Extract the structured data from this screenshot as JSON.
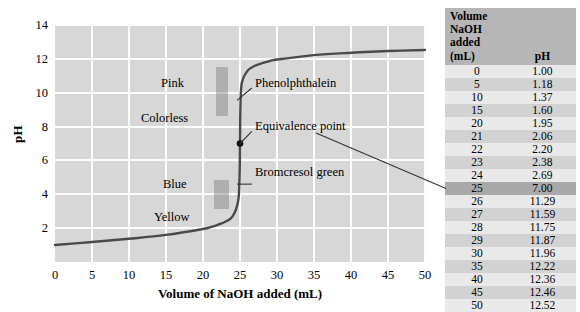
{
  "chart_data": {
    "type": "line",
    "title": "",
    "xlabel": "Volume of NaOH added (mL)",
    "ylabel": "pH",
    "xlim": [
      0,
      50
    ],
    "ylim": [
      0,
      14
    ],
    "xticks": [
      0,
      5,
      10,
      15,
      20,
      25,
      30,
      35,
      40,
      45,
      50
    ],
    "yticks": [
      2,
      4,
      6,
      8,
      10,
      12,
      14
    ],
    "grid": true,
    "legend": "none",
    "x": [
      0,
      5,
      10,
      15,
      20,
      21,
      22,
      23,
      24,
      25,
      26,
      27,
      28,
      29,
      30,
      35,
      40,
      45,
      50
    ],
    "y": [
      1.0,
      1.18,
      1.37,
      1.6,
      1.95,
      2.06,
      2.2,
      2.38,
      2.69,
      7.0,
      11.29,
      11.59,
      11.75,
      11.87,
      11.96,
      12.22,
      12.36,
      12.46,
      12.52
    ],
    "series": [
      {
        "name": "Titration curve",
        "values": [
          1.0,
          1.18,
          1.37,
          1.6,
          1.95,
          2.06,
          2.2,
          2.38,
          2.69,
          7.0,
          11.29,
          11.59,
          11.75,
          11.87,
          11.96,
          12.22,
          12.36,
          12.46,
          12.52
        ]
      }
    ],
    "annotations": [
      {
        "label": "Pink",
        "x": 14.5,
        "y": 10.3
      },
      {
        "label": "Colorless",
        "x": 11.5,
        "y": 8.2
      },
      {
        "label": "Blue",
        "x": 14.6,
        "y": 4.9
      },
      {
        "label": "Yellow",
        "x": 13.5,
        "y": 3.0
      },
      {
        "label": "Phenolphthalein",
        "x": 27.0,
        "y": 10.3
      },
      {
        "label": "Equivalence point",
        "x": 27.0,
        "y": 7.7
      },
      {
        "label": "Bromcresol green",
        "x": 27.0,
        "y": 5.0
      }
    ],
    "equivalence_point": {
      "x": 25,
      "y": 7.0
    },
    "indicator_bands": [
      {
        "name": "Phenolphthalein",
        "ph_low": 8.3,
        "ph_high": 10.6
      },
      {
        "name": "Bromcresol green",
        "ph_low": 3.8,
        "ph_high": 5.4
      }
    ]
  },
  "axes": {
    "y_title": "pH",
    "x_title": "Volume of NaOH added (mL)",
    "y_ticks": [
      "14",
      "12",
      "10",
      "8",
      "6",
      "4",
      "2"
    ],
    "x_ticks": [
      "0",
      "5",
      "10",
      "15",
      "20",
      "25",
      "30",
      "35",
      "40",
      "45",
      "50"
    ]
  },
  "annotations": {
    "pink": "Pink",
    "colorless": "Colorless",
    "blue": "Blue",
    "yellow": "Yellow",
    "phenolphthalein": "Phenolphthalein",
    "equivalence_point": "Equivalence point",
    "bromcresol_green": "Bromcresol green"
  },
  "table": {
    "headers": {
      "volume": "Volume NaOH added (mL)",
      "volume_line1": "Volume NaOH",
      "volume_line2": "added (mL)",
      "ph": "pH"
    },
    "rows": [
      {
        "volume": "0",
        "ph": "1.00",
        "highlight": false
      },
      {
        "volume": "5",
        "ph": "1.18",
        "highlight": false
      },
      {
        "volume": "10",
        "ph": "1.37",
        "highlight": false
      },
      {
        "volume": "15",
        "ph": "1.60",
        "highlight": false
      },
      {
        "volume": "20",
        "ph": "1.95",
        "highlight": false
      },
      {
        "volume": "21",
        "ph": "2.06",
        "highlight": false
      },
      {
        "volume": "22",
        "ph": "2.20",
        "highlight": false
      },
      {
        "volume": "23",
        "ph": "2.38",
        "highlight": false
      },
      {
        "volume": "24",
        "ph": "2.69",
        "highlight": false
      },
      {
        "volume": "25",
        "ph": "7.00",
        "highlight": true
      },
      {
        "volume": "26",
        "ph": "11.29",
        "highlight": false
      },
      {
        "volume": "27",
        "ph": "11.59",
        "highlight": false
      },
      {
        "volume": "28",
        "ph": "11.75",
        "highlight": false
      },
      {
        "volume": "29",
        "ph": "11.87",
        "highlight": false
      },
      {
        "volume": "30",
        "ph": "11.96",
        "highlight": false
      },
      {
        "volume": "35",
        "ph": "12.22",
        "highlight": false
      },
      {
        "volume": "40",
        "ph": "12.36",
        "highlight": false
      },
      {
        "volume": "45",
        "ph": "12.46",
        "highlight": false
      },
      {
        "volume": "50",
        "ph": "12.52",
        "highlight": false
      }
    ]
  },
  "colors": {
    "plot_background": "#d7d7d7",
    "gridline": "#fdfdfd",
    "curve": "#4a4a4a",
    "table_header": "#b6b6b6",
    "table_row_light": "#e9e9e9",
    "table_row_dark": "#d2d2d2",
    "table_row_highlight": "#a9a9a9",
    "indicator_band": "#787878"
  }
}
